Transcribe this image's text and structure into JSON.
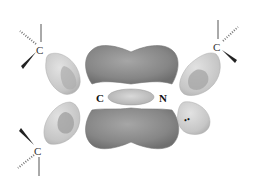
{
  "diagram": {
    "type": "molecular-orbital",
    "atoms": {
      "central_carbon": "C",
      "central_nitrogen": "N",
      "substituent_top_left": "C",
      "substituent_top_right": "C",
      "substituent_bottom_left": "C"
    },
    "lone_pair": "••",
    "colors": {
      "pi_lobe": "#8a8a8a",
      "pi_lobe_highlight": "#a8a8a8",
      "sigma_lobe": "#cfcfcf",
      "sigma_lobe_inner": "#a9a9a9",
      "bond_line": "#555555",
      "label": "#111111"
    }
  }
}
